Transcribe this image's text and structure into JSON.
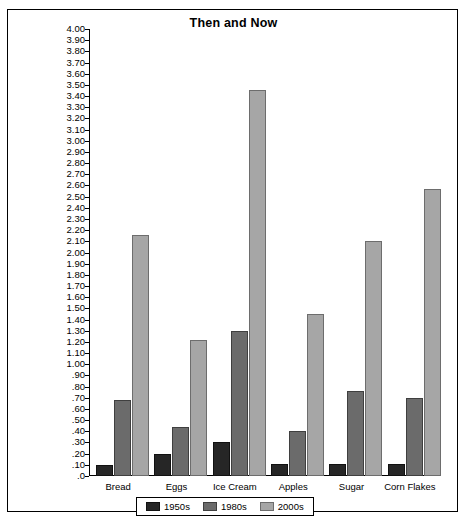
{
  "chart_data": {
    "type": "bar",
    "title": "Then and Now",
    "xlabel": "",
    "ylabel": "Cost of Items (in dollars)",
    "ylim": [
      0,
      4.0
    ],
    "ytick_step": 0.1,
    "grid": false,
    "legend_position": "bottom",
    "categories": [
      "Bread",
      "Eggs",
      "Ice Cream",
      "Apples",
      "Sugar",
      "Corn Flakes"
    ],
    "series": [
      {
        "name": "1950s",
        "color": "#262626",
        "values": [
          0.1,
          0.2,
          0.3,
          0.11,
          0.11,
          0.11
        ]
      },
      {
        "name": "1980s",
        "color": "#6b6b6b",
        "values": [
          0.68,
          0.44,
          1.3,
          0.4,
          0.76,
          0.7
        ]
      },
      {
        "name": "2000s",
        "color": "#a6a6a6",
        "values": [
          2.16,
          1.22,
          3.45,
          1.45,
          2.1,
          2.57
        ]
      }
    ],
    "ytick_labels": [
      "4.00",
      "3.90",
      "3.80",
      "3.70",
      "3.60",
      "3.50",
      "3.40",
      "3.30",
      "3.20",
      "3.10",
      "3.00",
      "2.90",
      "2.80",
      "2.70",
      "2.60",
      "2.50",
      "2.40",
      "2.30",
      "2.20",
      "2.10",
      "2.00",
      "1.90",
      "1.80",
      "1.70",
      "1.60",
      "1.50",
      "1.40",
      "1.30",
      "1.20",
      "1.10",
      "1.00",
      ".90",
      ".80",
      ".70",
      ".60",
      ".50",
      ".40",
      ".30",
      ".20",
      ".10",
      ".0"
    ]
  }
}
